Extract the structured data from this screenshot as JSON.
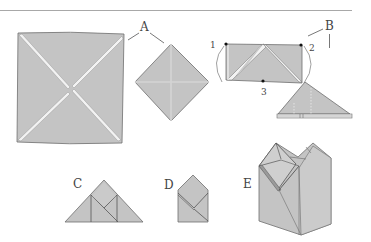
{
  "figure": {
    "type": "origami-instruction-diagram",
    "colors": {
      "paper": "#c4c4c4",
      "paper_light": "#d2d2d2",
      "edge": "#6e6e6e",
      "crease_gap": "#f2f2f2",
      "rule_line": "#a8a8a8",
      "label": "#444444"
    },
    "steps": [
      {
        "id": "A",
        "label": "A",
        "description": "Square sheet with both diagonals creased; folded into diamond with center creases"
      },
      {
        "id": "B",
        "label": "B",
        "description": "Rectangle with corner points marked, folded into triangle",
        "points": [
          "1",
          "2",
          "3"
        ]
      },
      {
        "id": "C",
        "label": "C",
        "description": "Triangle with inner folded flaps"
      },
      {
        "id": "D",
        "label": "D",
        "description": "Pentagon house-shaped fold"
      },
      {
        "id": "E",
        "label": "E",
        "description": "Finished 3D box / vase shape"
      }
    ]
  },
  "labels": {
    "A": "A",
    "B": "B",
    "C": "C",
    "D": "D",
    "E": "E",
    "p1": "1",
    "p2": "2",
    "p3": "3"
  }
}
